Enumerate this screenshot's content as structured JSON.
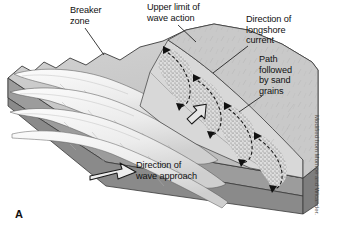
{
  "figure": {
    "letter": "A",
    "credit": "Modified from Monroe and Wicander.",
    "background_color": "#ffffff"
  },
  "labels": {
    "breaker_zone": "Breaker\nzone",
    "upper_limit": "Upper limit of\nwave action",
    "longshore_current": "Direction of\nlongshore\ncurrent",
    "sand_path": "Path\nfollowed\nby sand\ngrains",
    "wave_approach": "Direction of\nwave approach"
  },
  "icons": {
    "longshore_current_arrow": "block-arrow-up-left",
    "wave_approach_arrow": "block-arrow-right",
    "sand_grain_path": "dashed-zigzag-arrow"
  },
  "colors": {
    "land_surface": "#c9c9c9",
    "block_side_left": "#8e8e8e",
    "block_side_front": "#9a9a9a",
    "water_surface": "#cccccc",
    "wave_crest": "#f2f2f2",
    "beach_sand": "#d6d6d6",
    "swash_stipple": "#555555",
    "outline": "#3a3a3a",
    "label_text": "#111111",
    "credit_text": "#4a4a4a"
  },
  "diagram": {
    "wave_crest_count": 4,
    "swash_cell_count": 4,
    "leader_lines": 5
  }
}
